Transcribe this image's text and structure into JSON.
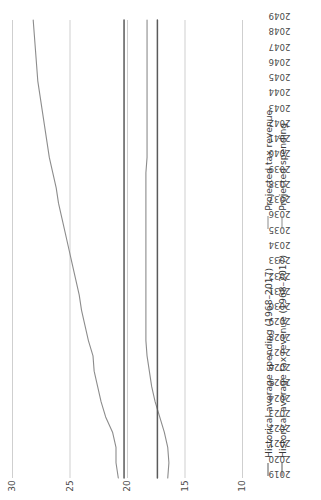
{
  "chart_data": {
    "type": "line",
    "title": "",
    "subtitle": "",
    "xlabel": "",
    "ylabel": "",
    "grid": true,
    "legend_position": "bottom",
    "xlim": [
      2019,
      2049
    ],
    "ylim": [
      10,
      30
    ],
    "yticks": [
      10,
      15,
      20,
      25,
      30
    ],
    "ytick_labels": [
      "10",
      "15",
      "20",
      "25",
      "30"
    ],
    "x": [
      2019,
      2020,
      2021,
      2022,
      2023,
      2024,
      2025,
      2026,
      2027,
      2028,
      2029,
      2030,
      2031,
      2032,
      2033,
      2034,
      2035,
      2036,
      2037,
      2038,
      2039,
      2040,
      2041,
      2042,
      2043,
      2044,
      2045,
      2046,
      2047,
      2048,
      2049
    ],
    "xtick_labels": [
      "2019",
      "2020",
      "2021",
      "2022",
      "2023",
      "2024",
      "2025",
      "2026",
      "2027",
      "2028",
      "2029",
      "2030",
      "2031",
      "2032",
      "2033",
      "2034",
      "2035",
      "2036",
      "2037",
      "2038",
      "2039",
      "2040",
      "2041",
      "2042",
      "2043",
      "2044",
      "2045",
      "2046",
      "2047",
      "2048",
      "2049"
    ],
    "series": [
      {
        "name": "Projected spending",
        "color": "#8c8c8c",
        "width": 1.1,
        "values": [
          20.8,
          21.0,
          21.0,
          21.3,
          21.9,
          22.3,
          22.6,
          22.9,
          23.0,
          23.4,
          23.7,
          24.0,
          24.2,
          24.5,
          24.8,
          25.1,
          25.4,
          25.7,
          26.0,
          26.2,
          26.5,
          26.8,
          27.0,
          27.2,
          27.4,
          27.6,
          27.8,
          27.9,
          28.0,
          28.1,
          28.2
        ]
      },
      {
        "name": "Projected tax revenue",
        "color": "#8c8c8c",
        "width": 1.1,
        "values": [
          16.5,
          16.4,
          16.5,
          16.8,
          17.2,
          17.6,
          17.9,
          18.1,
          18.3,
          18.4,
          18.4,
          18.4,
          18.4,
          18.4,
          18.4,
          18.4,
          18.4,
          18.4,
          18.4,
          18.4,
          18.4,
          18.3,
          18.3,
          18.3,
          18.3,
          18.3,
          18.3,
          18.3,
          18.3,
          18.3,
          18.3
        ]
      },
      {
        "name": "Historical average spending (1968–2017)",
        "color": "#5a5a5a",
        "width": 1.5,
        "values": [
          20.3,
          20.3,
          20.3,
          20.3,
          20.3,
          20.3,
          20.3,
          20.3,
          20.3,
          20.3,
          20.3,
          20.3,
          20.3,
          20.3,
          20.3,
          20.3,
          20.3,
          20.3,
          20.3,
          20.3,
          20.3,
          20.3,
          20.3,
          20.3,
          20.3,
          20.3,
          20.3,
          20.3,
          20.3,
          20.3,
          20.3
        ]
      },
      {
        "name": "Historical average tax revenue (1968–2017)",
        "color": "#5a5a5a",
        "width": 1.5,
        "values": [
          17.4,
          17.4,
          17.4,
          17.4,
          17.4,
          17.4,
          17.4,
          17.4,
          17.4,
          17.4,
          17.4,
          17.4,
          17.4,
          17.4,
          17.4,
          17.4,
          17.4,
          17.4,
          17.4,
          17.4,
          17.4,
          17.4,
          17.4,
          17.4,
          17.4,
          17.4,
          17.4,
          17.4,
          17.4,
          17.4,
          17.4
        ]
      }
    ],
    "legend": [
      {
        "label": "Historical average spending (1968–2017)",
        "color": "#5a5a5a",
        "width": 1.5
      },
      {
        "label": "Projected tax revenue",
        "color": "#8c8c8c",
        "width": 1.1
      },
      {
        "label": "Historical average tax revenue (1968–2017)",
        "color": "#5a5a5a",
        "width": 1.5
      },
      {
        "label": "Projected spending",
        "color": "#8c8c8c",
        "width": 1.1
      }
    ],
    "colors": {
      "gridline": "#c9c9c9",
      "historical": "#5a5a5a",
      "projected": "#8c8c8c",
      "text": "#3b3b3b",
      "background": "#ffffff"
    }
  }
}
